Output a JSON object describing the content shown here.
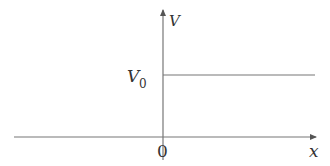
{
  "diagram": {
    "type": "step_function",
    "x_axis": {
      "label": "x",
      "origin_label": "0"
    },
    "y_axis": {
      "label": "V"
    },
    "step": {
      "level_label": "V",
      "level_subscript": "0",
      "description": "V = 0 for x < 0, V = V0 for x > 0"
    },
    "colors": {
      "axis": "#777777",
      "step": "#777777",
      "text": "#333333",
      "background": "#ffffff"
    }
  }
}
